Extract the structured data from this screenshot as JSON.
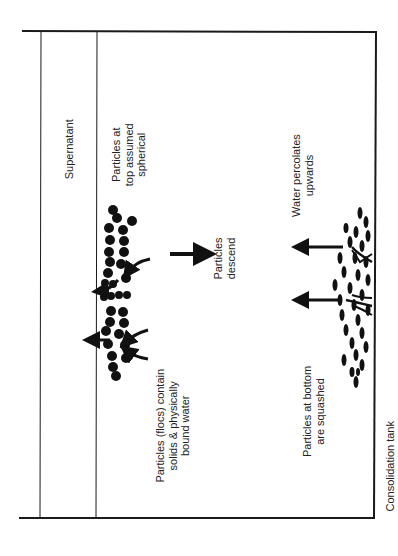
{
  "diagram": {
    "title": "Consolidation tank",
    "regions": [
      {
        "id": "supernatant",
        "label": "Supernatant"
      },
      {
        "id": "top",
        "label_lines": [
          "Particles at",
          "top assumed",
          "spherical"
        ]
      }
    ],
    "labels": {
      "supernatant": "Supernatant",
      "top_spherical": [
        "Particles at",
        "top assumed",
        "spherical"
      ],
      "flocs": [
        "Particles (flocs) contain",
        "solids & physically",
        "bound water"
      ],
      "descend": [
        "Particles",
        "descend"
      ],
      "percolates": [
        "Water percolates",
        "upwards"
      ],
      "squashed": [
        "Particles at bottom",
        "are squashed"
      ],
      "tank": "Consolidation tank"
    },
    "colors": {
      "line": "#1a1a1a",
      "particle": "#111111",
      "background": "#ffffff"
    }
  }
}
